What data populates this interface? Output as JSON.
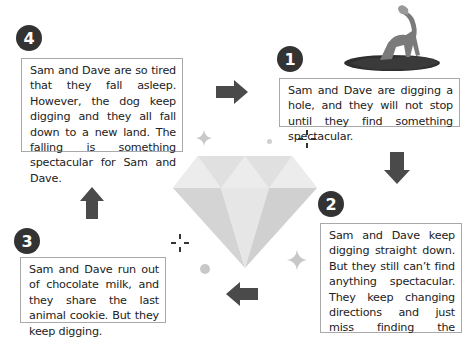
{
  "steps": [
    {
      "number": "1",
      "text": "Sam and Dave are digging a hole, and they will not stop until they find something spectacular."
    },
    {
      "number": "2",
      "text": "Sam and Dave keep digging straight down. But they still can’t find anything spectacular. They keep changing directions and just miss finding the diamonds."
    },
    {
      "number": "3",
      "text": "Sam and Dave run out of chocolate milk, and they share the last animal cookie. But they keep digging."
    },
    {
      "number": "4",
      "text": "Sam and Dave are so tired that they fall asleep. However, the dog keep digging and they all fall down to a new land. The falling is something spectacular for Sam and Dave."
    }
  ],
  "icons": {
    "center": "diamond-icon",
    "illustration": "dog-digging-icon",
    "arrows": [
      "arrow-right-icon",
      "arrow-down-icon",
      "arrow-left-icon",
      "arrow-up-icon"
    ]
  },
  "colors": {
    "badge": "#333333",
    "arrow": "#4a4a4a",
    "box_border": "#a9a9a9",
    "diamond_light": "#ececec",
    "diamond_mid": "#dcdcdc",
    "diamond_dark": "#cfcfcf",
    "sparkle": "#c8c8c8"
  }
}
